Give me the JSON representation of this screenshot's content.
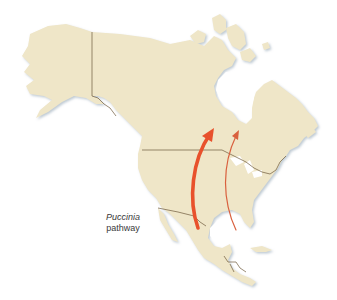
{
  "map": {
    "region": "North America",
    "colors": {
      "background": "#ffffff",
      "land": "#efe6c8",
      "land_shadow": "#c9d3dc",
      "border": "#6e5a3c",
      "arrow_major": "#e8512c",
      "arrow_minor": "#d9603e"
    },
    "label": {
      "italic": "Puccinia",
      "plain": "pathway"
    },
    "arrows": [
      {
        "name": "primary-pathway",
        "from": "Mexico / Texas",
        "to": "Canadian prairies",
        "weight": "thick"
      },
      {
        "name": "secondary-pathway",
        "from": "Gulf of Mexico coast",
        "to": "Ontario",
        "weight": "thin"
      }
    ]
  }
}
